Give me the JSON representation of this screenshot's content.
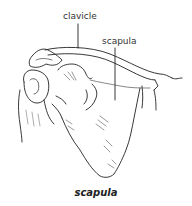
{
  "figure": {
    "labels": {
      "clavicle": "clavicle",
      "scapula": "scapula"
    },
    "caption": "scapula",
    "colors": {
      "line": "#222222",
      "shading": "#555555",
      "background": "#ffffff"
    }
  }
}
